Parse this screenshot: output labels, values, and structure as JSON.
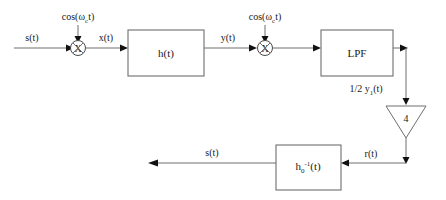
{
  "diagram": {
    "blocks": [
      {
        "id": "h",
        "label": "h(t)",
        "shape": "rect"
      },
      {
        "id": "lpf",
        "label": "LPF",
        "shape": "rect"
      },
      {
        "id": "gain",
        "label": "4",
        "shape": "triangle"
      },
      {
        "id": "hinv",
        "label_base": "h",
        "label_sub": "0",
        "label_sup": "-1",
        "label_tail": "(t)",
        "shape": "rect"
      }
    ],
    "multipliers": [
      {
        "id": "mixer-1",
        "symbol": "X"
      },
      {
        "id": "mixer-2",
        "symbol": "X"
      }
    ],
    "carriers": [
      {
        "id": "carrier-1",
        "prefix": "cos(",
        "omega": "ω",
        "sub": "c",
        "suffix": "t)"
      },
      {
        "id": "carrier-2",
        "prefix": "cos(",
        "omega": "ω",
        "sub": "c",
        "suffix": "t)"
      }
    ],
    "signals": {
      "input": "s(t)",
      "after_mixer1": "x(t)",
      "after_h": "y(t)",
      "after_lpf_base": "1/2 y",
      "after_lpf_sub": "1",
      "after_lpf_tail": "(t)",
      "after_gain": "r(t)",
      "output": "s(t)"
    }
  }
}
